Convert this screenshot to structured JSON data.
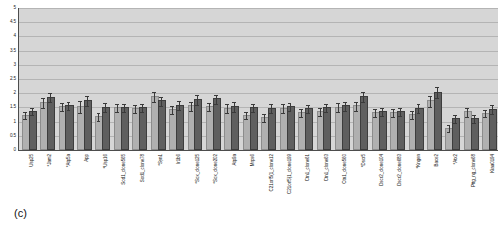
{
  "panel_label": "(c)",
  "chart_data": {
    "type": "bar",
    "title": "",
    "xlabel": "",
    "ylabel": "",
    "ylim": [
      0,
      5
    ],
    "ytick_step": 0.5,
    "ytick_labels": [
      "5",
      "4.5",
      "4",
      "3.5",
      "3",
      "2.5",
      "2",
      "1.5",
      "1",
      "0.5",
      "0"
    ],
    "ytick_values": [
      5,
      4.5,
      4,
      3.5,
      3,
      2.5,
      2,
      1.5,
      1,
      0.5,
      0
    ],
    "grid": true,
    "legend_position": "none",
    "plot_bgcolor": "#d6d6d6",
    "categories": [
      "Usp25",
      "*Jam2",
      "*Atp5a",
      "App",
      "*Usp16",
      "Sod1_clone565",
      "Sod1_clone78",
      "*Syn1",
      "Ir1b6",
      "*Sox_clone125",
      "*Sox_clone202",
      "Atp9a",
      "Mrps6",
      "C21orf5(1_clone12",
      "C21orf5(1_clone199",
      "Ctn1_clone61",
      "Ctn1_clone63",
      "Ctn1_clone560",
      "*Dscr5",
      "Dscr2_clone104",
      "Dscr2_clone683",
      "*Kngen",
      "Bace2",
      "*Atx2",
      "Pttg_ng_clone68",
      "Kiaa0194"
    ],
    "series": [
      {
        "name": "light-gray-series",
        "color": "#b0b0b0",
        "values": [
          1.18,
          1.62,
          1.48,
          1.48,
          1.12,
          1.45,
          1.42,
          1.82,
          1.38,
          1.5,
          1.48,
          1.42,
          1.18,
          1.1,
          1.42,
          1.28,
          1.3,
          1.45,
          1.5,
          1.28,
          1.28,
          1.2,
          1.68,
          0.72,
          1.3,
          1.25
        ],
        "errors": [
          0.14,
          0.16,
          0.14,
          0.2,
          0.14,
          0.14,
          0.14,
          0.18,
          0.14,
          0.16,
          0.14,
          0.16,
          0.12,
          0.14,
          0.16,
          0.14,
          0.14,
          0.16,
          0.16,
          0.14,
          0.14,
          0.14,
          0.2,
          0.12,
          0.16,
          0.14
        ]
      },
      {
        "name": "dark-gray-series",
        "color": "#5f5f5f",
        "values": [
          1.32,
          1.8,
          1.5,
          1.68,
          1.45,
          1.45,
          1.45,
          1.68,
          1.52,
          1.72,
          1.75,
          1.48,
          1.45,
          1.42,
          1.48,
          1.42,
          1.45,
          1.5,
          1.82,
          1.32,
          1.3,
          1.42,
          1.98,
          1.05,
          1.05,
          1.38
        ],
        "errors": [
          0.12,
          0.16,
          0.14,
          0.18,
          0.16,
          0.14,
          0.14,
          0.16,
          0.16,
          0.18,
          0.16,
          0.16,
          0.14,
          0.16,
          0.14,
          0.14,
          0.14,
          0.16,
          0.18,
          0.14,
          0.14,
          0.16,
          0.2,
          0.14,
          0.14,
          0.16
        ]
      }
    ]
  }
}
